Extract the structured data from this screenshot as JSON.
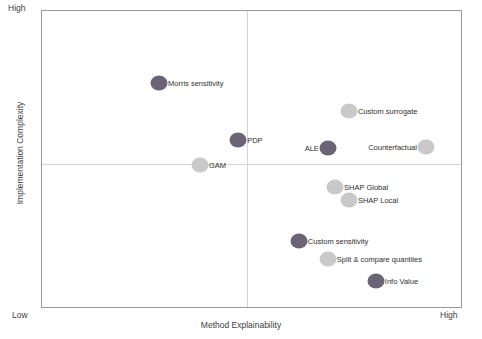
{
  "chart_data": {
    "type": "scatter",
    "title": "",
    "xlabel": "Method Explainability",
    "ylabel": "Implementation Complexity",
    "x_tick_labels": [
      "Low",
      "High"
    ],
    "y_tick_labels": [
      "Low",
      "High"
    ],
    "xlim": [
      0,
      100
    ],
    "ylim": [
      0,
      100
    ],
    "grid": false,
    "legend": "none",
    "quadrant_divider_x": 48.7,
    "quadrant_divider_y": 48.7,
    "colors": {
      "dark_marker": "#6b6474",
      "light_marker": "#c9c9c9",
      "frame": "#9a9a9a",
      "divider": "#d5d5d5",
      "text": "#2f2f2f"
    },
    "points": [
      {
        "label": "Morris sensitivity",
        "x": 27.8,
        "y": 75.8,
        "shade": "dark",
        "label_side": "right"
      },
      {
        "label": "Custom surrogate",
        "x": 72.9,
        "y": 66.4,
        "shade": "light",
        "label_side": "right"
      },
      {
        "label": "PDP",
        "x": 46.6,
        "y": 56.7,
        "shade": "dark",
        "label_side": "right"
      },
      {
        "label": "ALE",
        "x": 67.9,
        "y": 54.0,
        "shade": "dark",
        "label_side": "left"
      },
      {
        "label": "Counterfactual",
        "x": 91.2,
        "y": 54.4,
        "shade": "light",
        "label_side": "left"
      },
      {
        "label": "GAM",
        "x": 37.5,
        "y": 48.3,
        "shade": "light",
        "label_side": "right"
      },
      {
        "label": "SHAP Global",
        "x": 69.6,
        "y": 41.0,
        "shade": "light",
        "label_side": "right"
      },
      {
        "label": "SHAP Local",
        "x": 72.9,
        "y": 36.6,
        "shade": "light",
        "label_side": "right"
      },
      {
        "label": "Custom sensitivity",
        "x": 61.0,
        "y": 22.8,
        "shade": "dark",
        "label_side": "right"
      },
      {
        "label": "Split & compare quantiles",
        "x": 67.9,
        "y": 16.8,
        "shade": "light",
        "label_side": "right"
      },
      {
        "label": "Info Value",
        "x": 79.3,
        "y": 9.4,
        "shade": "dark",
        "label_side": "right"
      }
    ]
  }
}
